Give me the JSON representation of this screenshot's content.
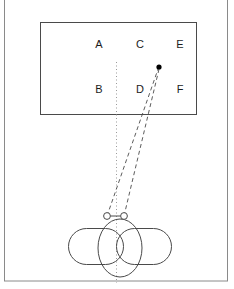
{
  "figure": {
    "background_color": "#ffffff",
    "stroke_color": "#4a4a4a",
    "label_color": "#1c1c1c",
    "dot_color": "#000000",
    "width": 234,
    "height": 289
  },
  "outer_frame": {
    "name": "outer-border",
    "x": 4,
    "y": 0,
    "width": 224,
    "height": 282,
    "stroke": "#8a8a8a"
  },
  "display_panel": {
    "name": "display-panel",
    "x": 40,
    "y": 22,
    "width": 157,
    "height": 93,
    "stroke": "#4a4a4a"
  },
  "panel_labels": {
    "top_row": [
      {
        "text": "A",
        "x": 99,
        "y": 45
      },
      {
        "text": "C",
        "x": 140,
        "y": 45
      },
      {
        "text": "E",
        "x": 180,
        "y": 45
      }
    ],
    "bottom_row": [
      {
        "text": "B",
        "x": 99,
        "y": 90
      },
      {
        "text": "D",
        "x": 140,
        "y": 90
      },
      {
        "text": "F",
        "x": 180,
        "y": 90
      }
    ]
  },
  "target_dot": {
    "name": "target-dot",
    "cx": 159,
    "cy": 67,
    "r": 2.6,
    "color": "#000000"
  },
  "midline": {
    "name": "vertical-midline",
    "x": 116,
    "y_top": 62,
    "y_bottom": 283,
    "dash": "1 2.5",
    "stroke": "#9a9a9a"
  },
  "sight_lines": [
    {
      "name": "sight-line-left-eye",
      "x1": 107,
      "y1": 216,
      "x2": 159,
      "y2": 67,
      "dash": "4 3"
    },
    {
      "name": "sight-line-right-eye",
      "x1": 124,
      "y1": 216,
      "x2": 159,
      "y2": 67,
      "dash": "4 3"
    }
  ],
  "observer": {
    "head": {
      "name": "head-outline",
      "cx": 120,
      "cy": 248,
      "rx": 22,
      "ry": 29
    },
    "left_shoulder": {
      "name": "left-shoulder",
      "x": 68,
      "y": 228,
      "width": 56,
      "height": 37,
      "radius": 18
    },
    "right_shoulder": {
      "name": "right-shoulder",
      "x": 116,
      "y": 228,
      "width": 56,
      "height": 37,
      "radius": 18
    },
    "eyes": [
      {
        "name": "left-eye",
        "cx": 107,
        "cy": 216,
        "r": 3.4
      },
      {
        "name": "right-eye",
        "cx": 124,
        "cy": 216,
        "r": 3.4
      }
    ],
    "interocular_line": {
      "name": "interocular-line",
      "x1": 110.4,
      "y1": 216,
      "x2": 120.6,
      "y2": 216
    }
  }
}
